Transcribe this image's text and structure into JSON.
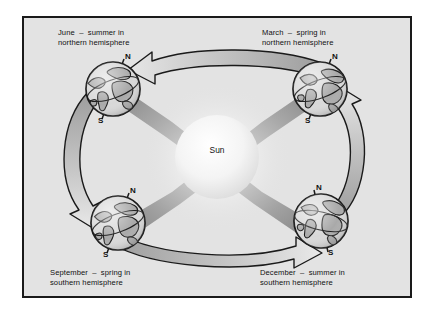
{
  "figure": {
    "kind": "seasons-orbit-diagram",
    "background_color": "#e3e3e3",
    "border_color": "#1a1a1a",
    "page_background": "#ffffff"
  },
  "center": {
    "label": "Sun",
    "color": "#f2f2f2"
  },
  "captions": {
    "june": "June  –  summer in\nnorthern hemisphere",
    "march": "March  –  spring in\nnorthern hemisphere",
    "september": "September  –  spring in\nsouthern hemisphere",
    "december": "December  –  summer in\nsouthern hemisphere"
  },
  "globes": [
    {
      "id": "june",
      "position": "top-left",
      "north_label": "N",
      "south_label": "S"
    },
    {
      "id": "march",
      "position": "top-right",
      "north_label": "N",
      "south_label": "S"
    },
    {
      "id": "september",
      "position": "bottom-left",
      "north_label": "N",
      "south_label": "S"
    },
    {
      "id": "december",
      "position": "bottom-right",
      "north_label": "N",
      "south_label": "S"
    }
  ],
  "orbit_arrows": [
    {
      "id": "top",
      "from": "march",
      "to": "june",
      "direction": "left"
    },
    {
      "id": "left",
      "from": "june",
      "to": "september",
      "direction": "down"
    },
    {
      "id": "bottom",
      "from": "september",
      "to": "december",
      "direction": "right"
    },
    {
      "id": "right",
      "from": "december",
      "to": "march",
      "direction": "up"
    }
  ],
  "sun_rays": [
    {
      "id": "ray-to-june",
      "target": "june"
    },
    {
      "id": "ray-to-march",
      "target": "march"
    },
    {
      "id": "ray-to-september",
      "target": "september"
    },
    {
      "id": "ray-to-december",
      "target": "december"
    }
  ],
  "colors": {
    "arrow_fill_light": "#d2d2d2",
    "arrow_fill_dark": "#9a9a9a",
    "outline": "#1a1a1a",
    "land": "#a9a9a9",
    "ocean": "#d8d8d8"
  }
}
